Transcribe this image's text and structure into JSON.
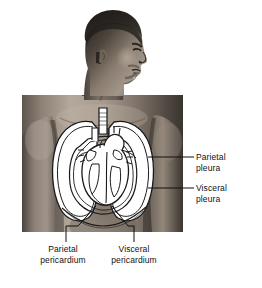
{
  "figure": {
    "background_color": "#ffffff"
  },
  "labels": {
    "parietal_pleura": {
      "line1": "Parietal",
      "line2": "pleura"
    },
    "visceral_pleura": {
      "line1": "Visceral",
      "line2": "pleura"
    },
    "parietal_pericardium": {
      "line1": "Parietal",
      "line2": "pericardium"
    },
    "visceral_pericardium": {
      "line1": "Visceral",
      "line2": "pericardium"
    }
  },
  "leader_lines": [
    {
      "name": "parietal-pleura-leader",
      "from_x": 148,
      "from_y": 157,
      "to_x": 194,
      "to_y": 157,
      "orientation": "horizontal"
    },
    {
      "name": "visceral-pleura-leader",
      "from_x": 148,
      "from_y": 188,
      "to_x": 194,
      "to_y": 188,
      "orientation": "horizontal"
    },
    {
      "name": "parietal-pericardium-leader",
      "from_x": 96,
      "from_y": 205,
      "to_x": 66,
      "to_y": 241,
      "orientation": "diagonal"
    },
    {
      "name": "visceral-pericardium-leader",
      "from_x": 112,
      "from_y": 205,
      "to_x": 134,
      "to_y": 241,
      "orientation": "diagonal"
    }
  ],
  "anatomy": {
    "structures": [
      "head-profile",
      "neck",
      "shoulders",
      "left-arm",
      "right-arm",
      "chest",
      "left-lung",
      "right-lung",
      "trachea",
      "heart",
      "great-vessels",
      "pleural-membrane",
      "pericardial-membrane",
      "diaphragm"
    ],
    "orientation": "anterior view of torso, head turned in right profile",
    "style": "grayscale photograph with white line-art overlay"
  },
  "colors": {
    "line_art": "#1a1a1a",
    "organ_fill": "#ffffff",
    "label_text": "#111111",
    "skin_mid": "#8a8076",
    "skin_dark": "#3d3833",
    "skin_light": "#c8bfb4"
  }
}
